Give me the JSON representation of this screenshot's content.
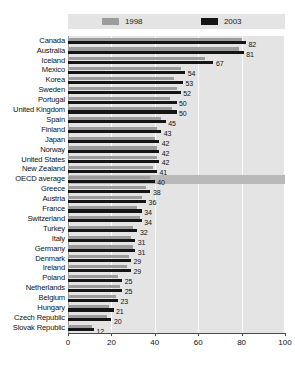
{
  "chart_data": {
    "type": "bar",
    "orientation": "horizontal",
    "title": "",
    "xlabel": "",
    "ylabel": "",
    "xlim": [
      0,
      100
    ],
    "xticks": [
      0,
      20,
      40,
      60,
      80,
      100
    ],
    "grid": true,
    "legend_position": "top",
    "categories": [
      "Canada",
      "Australia",
      "Iceland",
      "Mexico",
      "Korea",
      "Sweden",
      "Portugal",
      "United Kingdom",
      "Spain",
      "Finland",
      "Japan",
      "Norway",
      "United States",
      "New Zealand",
      "OECD average",
      "Greece",
      "Austria",
      "France",
      "Switzerland",
      "Turkey",
      "Italy",
      "Germany",
      "Denmark",
      "Ireland",
      "Poland",
      "Netherlands",
      "Belgium",
      "Hungary",
      "Czech Republic",
      "Slovak Republic"
    ],
    "highlight_category": "OECD average",
    "series": [
      {
        "name": "1998",
        "color": "#9c9c9c",
        "values": [
          80,
          79,
          63,
          52,
          49,
          50,
          47,
          48,
          43,
          41,
          40,
          41,
          41,
          39,
          38,
          36,
          34,
          32,
          33,
          30,
          29,
          30,
          28,
          27,
          23,
          24,
          22,
          19,
          18,
          11
        ]
      },
      {
        "name": "2003",
        "color": "#151515",
        "values": [
          82,
          81,
          67,
          54,
          53,
          52,
          50,
          50,
          45,
          43,
          42,
          42,
          42,
          41,
          40,
          38,
          36,
          34,
          34,
          32,
          31,
          31,
          29,
          29,
          25,
          25,
          23,
          21,
          20,
          12
        ]
      }
    ],
    "value_labels": [
      82,
      81,
      67,
      54,
      53,
      52,
      50,
      50,
      45,
      43,
      42,
      42,
      42,
      41,
      40,
      38,
      36,
      34,
      34,
      32,
      31,
      31,
      29,
      29,
      25,
      25,
      23,
      21,
      20,
      12
    ]
  },
  "legend": {
    "entries": [
      {
        "label": "1998",
        "color": "#9c9c9c"
      },
      {
        "label": "2003",
        "color": "#151515"
      }
    ]
  }
}
